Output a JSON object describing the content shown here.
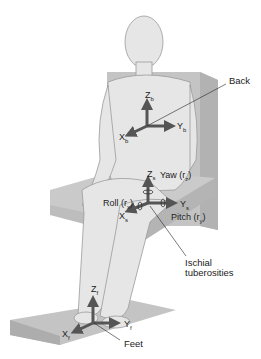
{
  "diagram": {
    "colors": {
      "skin": "#e3e3e3",
      "outline": "#9a9a9a",
      "seat": "#c8c8c8",
      "seat_dark": "#b0b0b0",
      "arrow": "#555555",
      "text": "#222222"
    },
    "frames": {
      "back": {
        "z": {
          "main": "Z",
          "sub": "b"
        },
        "x": {
          "main": "X",
          "sub": "b"
        },
        "y": {
          "main": "Y",
          "sub": "b"
        }
      },
      "seat": {
        "z": {
          "main": "Z",
          "sub": "s"
        },
        "x": {
          "main": "X",
          "sub": "s"
        },
        "y": {
          "main": "Y",
          "sub": "s"
        },
        "yaw": {
          "main": "Yaw (r",
          "sub": "z",
          "end": ")"
        },
        "roll": {
          "main": "Roll (r",
          "sub": "x",
          "end": ")"
        },
        "pitch": {
          "main": "Pitch (r",
          "sub": "y",
          "end": ")"
        }
      },
      "feet": {
        "z": {
          "main": "Z",
          "sub": "f"
        },
        "x": {
          "main": "X",
          "sub": "f"
        },
        "y": {
          "main": "Y",
          "sub": "f"
        }
      }
    },
    "callouts": {
      "back": "Back",
      "ischial_line1": "Ischial",
      "ischial_line2": "tuberosities",
      "feet": "Feet"
    }
  }
}
